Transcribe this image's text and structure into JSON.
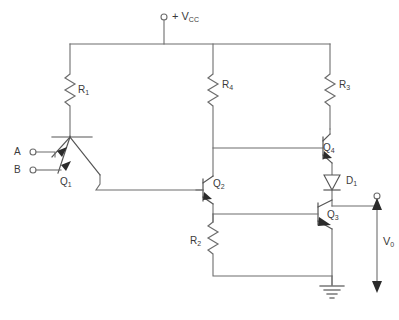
{
  "diagram": {
    "supply_label": "+ V",
    "supply_sub": "CC",
    "ground_label": "",
    "labels": {
      "r1": {
        "text": "R",
        "sub": "1"
      },
      "r2": {
        "text": "R",
        "sub": "2"
      },
      "r3": {
        "text": "R",
        "sub": "3"
      },
      "r4": {
        "text": "R",
        "sub": "4"
      },
      "q1": {
        "text": "Q",
        "sub": "1"
      },
      "q2": {
        "text": "Q",
        "sub": "2"
      },
      "q3": {
        "text": "Q",
        "sub": "3"
      },
      "q4": {
        "text": "Q",
        "sub": "4"
      },
      "d1": {
        "text": "D",
        "sub": "1"
      },
      "vo": {
        "text": "V",
        "sub": "0"
      },
      "input_a": {
        "text": "A",
        "sub": ""
      },
      "input_b": {
        "text": "B",
        "sub": ""
      }
    },
    "components": [
      {
        "id": "R1",
        "type": "resistor",
        "name": "r1-resistor"
      },
      {
        "id": "R2",
        "type": "resistor",
        "name": "r2-resistor"
      },
      {
        "id": "R3",
        "type": "resistor",
        "name": "r3-resistor"
      },
      {
        "id": "R4",
        "type": "resistor",
        "name": "r4-resistor"
      },
      {
        "id": "Q1",
        "type": "multi-emitter-npn-transistor",
        "name": "q1-transistor"
      },
      {
        "id": "Q2",
        "type": "npn-transistor",
        "name": "q2-transistor"
      },
      {
        "id": "Q3",
        "type": "npn-transistor",
        "name": "q3-transistor"
      },
      {
        "id": "Q4",
        "type": "npn-transistor",
        "name": "q4-transistor"
      },
      {
        "id": "D1",
        "type": "diode",
        "name": "d1-diode"
      }
    ],
    "terminals": [
      {
        "id": "VCC",
        "name": "vcc-terminal"
      },
      {
        "id": "A",
        "name": "input-a-terminal"
      },
      {
        "id": "B",
        "name": "input-b-terminal"
      },
      {
        "id": "VO",
        "name": "output-terminal"
      },
      {
        "id": "GND",
        "name": "ground-symbol"
      }
    ],
    "colors": {
      "wire": "#6d6d6d",
      "text": "#3a3a3a",
      "fill": "#ffffff",
      "arrow": "#2b2b2b"
    }
  }
}
